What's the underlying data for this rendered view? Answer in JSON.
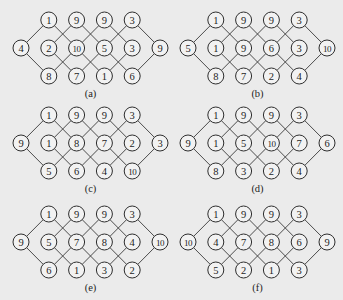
{
  "figure": {
    "panels": [
      {
        "id": "a",
        "label": "(a)",
        "top": [
          "1",
          "9",
          "9",
          "3"
        ],
        "middle": [
          "4",
          "2",
          "10",
          "5",
          "3",
          "9"
        ],
        "bottom": [
          "8",
          "7",
          "1",
          "6"
        ]
      },
      {
        "id": "b",
        "label": "(b)",
        "top": [
          "1",
          "9",
          "9",
          "3"
        ],
        "middle": [
          "5",
          "1",
          "9",
          "6",
          "3",
          "10"
        ],
        "bottom": [
          "8",
          "7",
          "2",
          "4"
        ]
      },
      {
        "id": "c",
        "label": "(c)",
        "top": [
          "1",
          "9",
          "9",
          "3"
        ],
        "middle": [
          "9",
          "1",
          "8",
          "7",
          "2",
          "3"
        ],
        "bottom": [
          "5",
          "6",
          "4",
          "10"
        ]
      },
      {
        "id": "d",
        "label": "(d)",
        "top": [
          "1",
          "9",
          "9",
          "3"
        ],
        "middle": [
          "9",
          "1",
          "5",
          "10",
          "7",
          "6"
        ],
        "bottom": [
          "8",
          "3",
          "2",
          "4"
        ]
      },
      {
        "id": "e",
        "label": "(e)",
        "top": [
          "1",
          "9",
          "9",
          "3"
        ],
        "middle": [
          "9",
          "5",
          "7",
          "8",
          "4",
          "10"
        ],
        "bottom": [
          "6",
          "1",
          "3",
          "2"
        ]
      },
      {
        "id": "f",
        "label": "(f)",
        "top": [
          "1",
          "9",
          "9",
          "3"
        ],
        "middle": [
          "10",
          "4",
          "7",
          "8",
          "6",
          "9"
        ],
        "bottom": [
          "5",
          "2",
          "1",
          "3"
        ]
      }
    ]
  },
  "colors": {
    "background": "#ebebeb",
    "stroke": "#2e2e2e",
    "node_fill": "#f2f2f2"
  }
}
